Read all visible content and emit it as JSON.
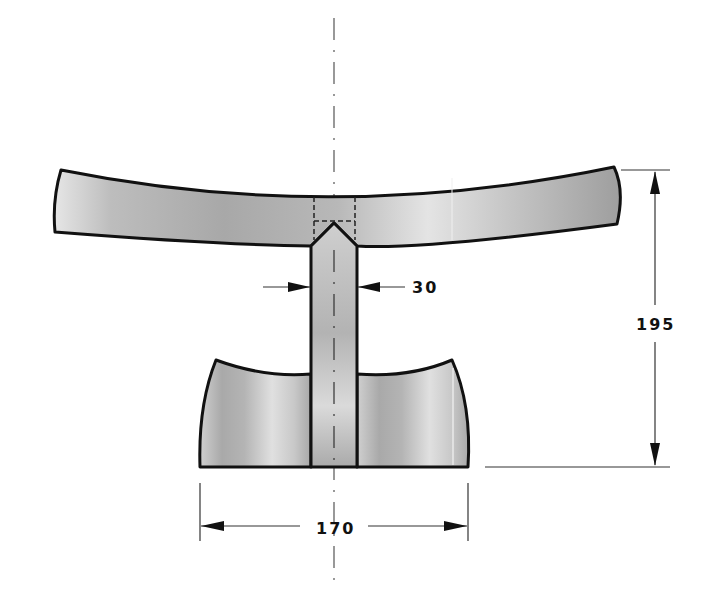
{
  "drawing": {
    "title": "Headrest technical drawing",
    "colors": {
      "outline": "#111111",
      "fill_light": "#e2e2e2",
      "fill_mid": "#bdbdbd",
      "fill_dark": "#9a9a9a",
      "dimension_line": "#333333",
      "centerline": "#555555"
    },
    "parts": [
      {
        "name": "curved-top-cradle"
      },
      {
        "name": "center-post"
      },
      {
        "name": "curved-base"
      }
    ],
    "dimensions": {
      "post_width": {
        "label": "30",
        "unit": "mm"
      },
      "overall_height": {
        "label": "195",
        "unit": "mm"
      },
      "base_width": {
        "label": "170",
        "unit": "mm"
      }
    }
  }
}
